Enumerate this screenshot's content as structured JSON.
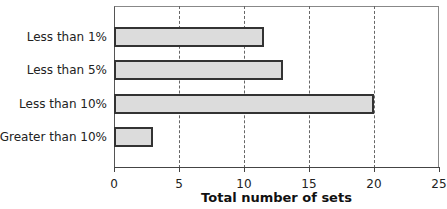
{
  "chart_data": {
    "type": "bar",
    "orientation": "horizontal",
    "title": "",
    "categories": [
      "Less than 1%",
      "Less than 5%",
      "Less than 10%",
      "Greater than 10%"
    ],
    "values": [
      11.5,
      13,
      20,
      3
    ],
    "xlabel": "Total number of sets",
    "ylabel": "",
    "xlim": [
      0,
      25
    ],
    "xticks": [
      0,
      5,
      10,
      15,
      20,
      25
    ],
    "xtick_labels": [
      "0",
      "5",
      "10",
      "15",
      "20",
      "25"
    ],
    "grid": "vertical dashed at 5,10,15,20",
    "legend": null,
    "colors": {
      "bar_fill": "#dcdcdc",
      "bar_border": "#333333"
    }
  }
}
